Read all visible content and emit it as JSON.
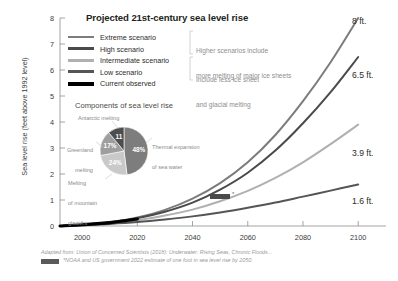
{
  "header": {
    "title": "Projected 21st-century sea level rise"
  },
  "axes": {
    "ylabel": "Sea level rise (feet above 1992 level)",
    "yticks": [
      "0",
      "1",
      "2",
      "3",
      "4",
      "5",
      "6",
      "7",
      "8"
    ],
    "xticks": [
      "2000",
      "2020",
      "2040",
      "2060",
      "2080",
      "2100"
    ]
  },
  "legend": {
    "items": [
      {
        "label": "Extreme scenario",
        "color": "#7c7c7c"
      },
      {
        "label": "High scenario",
        "color": "#4a4a4a"
      },
      {
        "label": "Intermediate scenario",
        "color": "#b0b0b0"
      },
      {
        "label": "Low scenario",
        "color": "#555555"
      },
      {
        "label": "Current observed",
        "color": "#000000"
      }
    ],
    "notes": [
      {
        "line1": "Higher scenarios include",
        "line2": "more melting of major ice sheets"
      },
      {
        "line1": "Include less ice sheet",
        "line2": "and glacial melting"
      }
    ]
  },
  "pie": {
    "title": "Components of sea level rise",
    "labels": {
      "antarctic": "Antarctic melting",
      "greenland_l1": "Greenland",
      "greenland_l2": "melting",
      "glaciers_l1": "Melting",
      "glaciers_l2": "of mountain",
      "glaciers_l3": "glaciers",
      "thermal_l1": "Thermal expansion",
      "thermal_l2": "of sea water"
    },
    "slices": [
      {
        "name": "Thermal expansion of sea water",
        "value": 48,
        "display": "48%",
        "color": "#7d7d7d"
      },
      {
        "name": "Melting of mountain glaciers",
        "value": 24,
        "display": "24%",
        "color": "#c9c9c9"
      },
      {
        "name": "Greenland melting",
        "value": 17,
        "display": "17%",
        "color": "#9e9e9e"
      },
      {
        "name": "Antarctic melting",
        "value": 11,
        "display": "11",
        "color": "#4d4d4d"
      }
    ]
  },
  "end_labels": [
    {
      "text": "8 ft.",
      "scenario": "Extreme scenario"
    },
    {
      "text": "6.5 ft.",
      "scenario": "High scenario"
    },
    {
      "text": "3.9 ft.",
      "scenario": "Intermediate scenario"
    },
    {
      "text": "1.6 ft.",
      "scenario": "Low scenario"
    }
  ],
  "marker": {
    "star": "*",
    "color": "#4a4a4a"
  },
  "footer": {
    "source": "Adapted from: Union of Concerned Scientists (2018): Underwater: Rising Seas, Chronic Floods...",
    "footnote": "*NOAA and US government 2022 estimate of one foot in sea level rise by 2050.",
    "swatch_color": "#5a5a5a"
  },
  "chart_data": {
    "type": "line",
    "title": "Projected 21st-century sea level rise",
    "xlabel": "",
    "ylabel": "Sea level rise (feet above 1992 level)",
    "xlim": [
      1992,
      2105
    ],
    "ylim": [
      0,
      8
    ],
    "grid": false,
    "legend_position": "top-left-inset",
    "x": [
      1992,
      2000,
      2010,
      2020,
      2030,
      2040,
      2050,
      2060,
      2070,
      2080,
      2090,
      2100
    ],
    "series": [
      {
        "name": "Extreme scenario",
        "color": "#7c7c7c",
        "end_label": "8 ft.",
        "values": [
          0.0,
          0.05,
          0.15,
          0.33,
          0.62,
          1.05,
          1.65,
          2.45,
          3.5,
          4.8,
          6.3,
          8.0
        ]
      },
      {
        "name": "High scenario",
        "color": "#4a4a4a",
        "end_label": "6.5 ft.",
        "values": [
          0.0,
          0.05,
          0.14,
          0.3,
          0.55,
          0.9,
          1.4,
          2.05,
          2.9,
          3.95,
          5.15,
          6.5
        ]
      },
      {
        "name": "Intermediate scenario",
        "color": "#b0b0b0",
        "end_label": "3.9 ft.",
        "values": [
          0.0,
          0.04,
          0.11,
          0.22,
          0.4,
          0.63,
          0.95,
          1.35,
          1.85,
          2.45,
          3.15,
          3.9
        ]
      },
      {
        "name": "Low scenario",
        "color": "#555555",
        "end_label": "1.6 ft.",
        "values": [
          0.0,
          0.03,
          0.08,
          0.15,
          0.25,
          0.37,
          0.52,
          0.7,
          0.9,
          1.13,
          1.36,
          1.6
        ]
      },
      {
        "name": "Current observed",
        "color": "#000000",
        "end_label": "",
        "values": [
          0.0,
          0.05,
          0.13,
          0.27,
          null,
          null,
          null,
          null,
          null,
          null,
          null,
          null
        ]
      }
    ],
    "annotations": [
      {
        "text": "*",
        "x": 2050,
        "y": 1.0,
        "note": "NOAA and US government 2022 estimate of one foot in sea level rise by 2050."
      }
    ],
    "inset_pie": {
      "type": "pie",
      "title": "Components of sea level rise",
      "categories": [
        "Thermal expansion of sea water",
        "Melting of mountain glaciers",
        "Greenland melting",
        "Antarctic melting"
      ],
      "values": [
        48,
        24,
        17,
        11
      ],
      "labels": [
        "48%",
        "24%",
        "17%",
        "11"
      ]
    }
  }
}
